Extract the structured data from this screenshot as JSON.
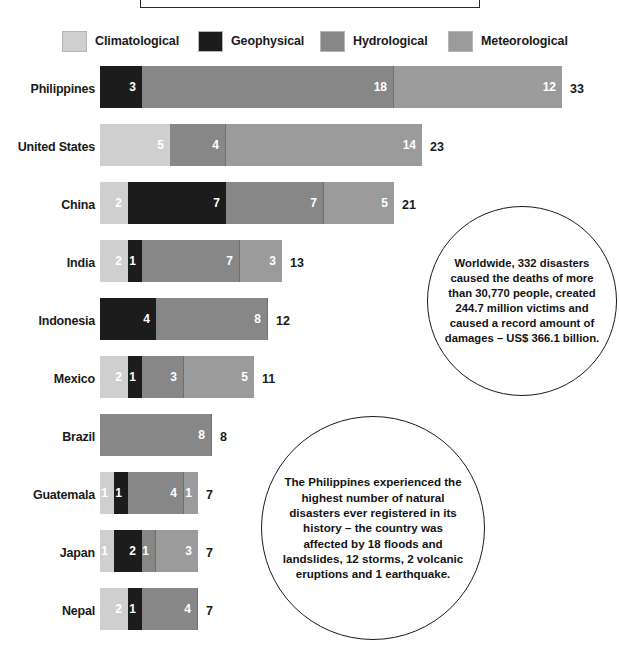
{
  "title": {
    "text": ""
  },
  "legend": {
    "position": "top",
    "items": [
      {
        "label": "Climatological",
        "color": "#cfcfcf",
        "x": 62
      },
      {
        "label": "Geophysical",
        "color": "#1c1c1c",
        "x": 198
      },
      {
        "label": "Hydrological",
        "color": "#878787",
        "x": 320
      },
      {
        "label": "Meteorological",
        "color": "#9b9b9b",
        "x": 448
      }
    ]
  },
  "chart_data": {
    "type": "bar",
    "orientation": "horizontal",
    "stacked": true,
    "title": "",
    "xlabel": "",
    "ylabel": "",
    "grid": false,
    "legend_position": "top",
    "categories": [
      "Philippines",
      "United States",
      "China",
      "India",
      "Indonesia",
      "Mexico",
      "Brazil",
      "Guatemala",
      "Japan",
      "Nepal"
    ],
    "series": [
      {
        "name": "Climatological",
        "color": "#cfcfcf",
        "values": [
          0,
          5,
          2,
          2,
          0,
          2,
          0,
          1,
          1,
          2
        ]
      },
      {
        "name": "Geophysical",
        "color": "#1c1c1c",
        "values": [
          3,
          0,
          7,
          1,
          4,
          1,
          0,
          1,
          2,
          1
        ]
      },
      {
        "name": "Hydrological",
        "color": "#878787",
        "values": [
          18,
          4,
          7,
          7,
          8,
          3,
          8,
          4,
          1,
          4
        ]
      },
      {
        "name": "Meteorological",
        "color": "#9b9b9b",
        "values": [
          12,
          14,
          5,
          3,
          0,
          5,
          0,
          1,
          3,
          0
        ]
      }
    ],
    "totals": [
      33,
      23,
      21,
      13,
      12,
      11,
      8,
      7,
      7,
      7
    ],
    "xlim": [
      0,
      33
    ],
    "px_per_unit": 14
  },
  "callouts": [
    {
      "name": "worldwide",
      "text": "Worldwide, 332 disasters caused the deaths of more than 30,770 people, created 244.7 million victims and caused a record amount of damages – US$ 366.1 billion."
    },
    {
      "name": "philippines",
      "text": "The Philippines experienced the highest number of natural disasters ever registered in its history – the country was affected by 18 floods and landslides, 12 storms, 2 volcanic eruptions and 1 earthquake."
    }
  ]
}
